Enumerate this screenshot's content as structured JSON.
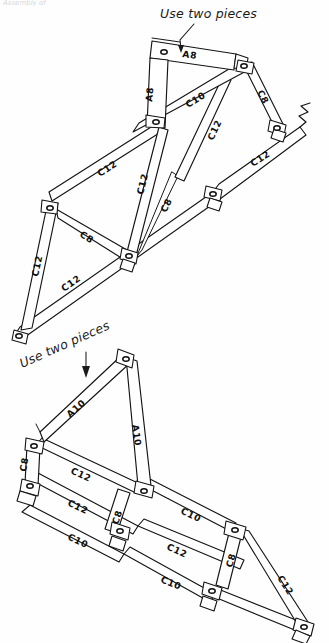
{
  "page": {
    "cropped_header": "Assembly of",
    "background_color": "#fefefe",
    "ink_color": "#141414"
  },
  "notes": [
    {
      "id": "note-top",
      "text": "Use two pieces",
      "points_to": "A8"
    },
    {
      "id": "note-bottom",
      "text": "Use two pieces",
      "points_to": "A10"
    }
  ],
  "trusses": [
    {
      "id": "truss-upper",
      "name": "Upper Truss Assembly",
      "members": [
        {
          "id": "u-a8-top",
          "label": "A8",
          "orientation": "horizontal"
        },
        {
          "id": "u-a8-vert",
          "label": "A8",
          "orientation": "vertical"
        },
        {
          "id": "u-c10-chord",
          "label": "C10",
          "orientation": "diagonal"
        },
        {
          "id": "u-c8-right",
          "label": "C8",
          "orientation": "diagonal"
        },
        {
          "id": "u-c12-right",
          "label": "C12",
          "orientation": "diagonal"
        },
        {
          "id": "u-c12-lower-r",
          "label": "C12",
          "orientation": "diagonal"
        },
        {
          "id": "u-c8-mid",
          "label": "C8",
          "orientation": "diagonal"
        },
        {
          "id": "u-c12-diag",
          "label": "C12",
          "orientation": "diagonal"
        },
        {
          "id": "u-c12-upper-l",
          "label": "C12",
          "orientation": "diagonal"
        },
        {
          "id": "u-c8-left",
          "label": "C8",
          "orientation": "diagonal"
        },
        {
          "id": "u-c12-left",
          "label": "C12",
          "orientation": "diagonal"
        },
        {
          "id": "u-c12-bottom",
          "label": "C12",
          "orientation": "diagonal"
        }
      ],
      "break_symbol": true,
      "joint_count": 8
    },
    {
      "id": "truss-lower",
      "name": "Lower Truss Assembly",
      "members": [
        {
          "id": "l-a10-top",
          "label": "A10",
          "orientation": "diagonal"
        },
        {
          "id": "l-a10-vert",
          "label": "A10",
          "orientation": "vertical"
        },
        {
          "id": "l-c12-upper",
          "label": "C12",
          "orientation": "diagonal"
        },
        {
          "id": "l-c8-left",
          "label": "C8",
          "orientation": "vertical"
        },
        {
          "id": "l-c12-mid",
          "label": "C12",
          "orientation": "diagonal"
        },
        {
          "id": "l-c10-chord",
          "label": "C10",
          "orientation": "diagonal"
        },
        {
          "id": "l-c8-diag1",
          "label": "C8",
          "orientation": "vertical"
        },
        {
          "id": "l-c12-low",
          "label": "C12",
          "orientation": "diagonal"
        },
        {
          "id": "l-c10-lower",
          "label": "C10",
          "orientation": "diagonal"
        },
        {
          "id": "l-c8-right",
          "label": "C8",
          "orientation": "vertical"
        },
        {
          "id": "l-c12-right",
          "label": "C12",
          "orientation": "diagonal"
        },
        {
          "id": "l-c10-bottom",
          "label": "C10",
          "orientation": "diagonal"
        }
      ],
      "break_symbol": false,
      "joint_count": 8
    }
  ],
  "labels": {
    "a8_top": "A8",
    "a8_vert": "A8",
    "u_c10": "C10",
    "u_c8_right": "C8",
    "u_c12_right": "C12",
    "u_c12_lower_right": "C12",
    "u_c8_mid": "C8",
    "u_c12_diag": "C12",
    "u_c12_upper_left": "C12",
    "u_c8_left": "C8",
    "u_c12_left": "C12",
    "u_c12_bottom": "C12",
    "a10_top": "A10",
    "a10_vert": "A10",
    "l_c12_upper": "C12",
    "l_c8_left": "C8",
    "l_c12_mid": "C12",
    "l_c10_chord": "C10",
    "l_c8_diag1": "C8",
    "l_c12_low": "C12",
    "l_c10_lower": "C10",
    "l_c8_right": "C8",
    "l_c12_right": "C12",
    "l_c10_bottom": "C10"
  }
}
